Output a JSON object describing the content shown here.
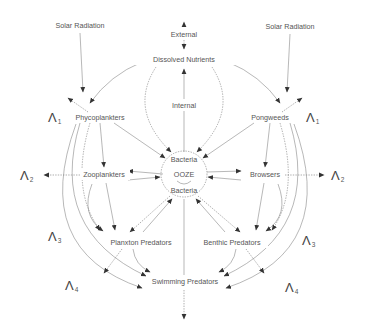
{
  "diagram": {
    "colors": {
      "line": "#888888",
      "text": "#555555",
      "background": "#ffffff"
    },
    "nodes": {
      "solar_left": "Solar Radiation",
      "solar_right": "Solar Radiation",
      "external": "External",
      "dissolved": "Dissolved Nutrients",
      "internal": "Internal",
      "phyco": "Phycoplankters",
      "pong": "Pongweeds",
      "bacteria_top": "Bacteria",
      "ooze": "OOZE",
      "bacteria_bottom": "Bacteria",
      "zoo": "Zooplankters",
      "browsers": "Browsers",
      "planxton_pred": "Planxton Predators",
      "benthic_pred": "Benthic Predators",
      "swimming_pred": "Swimming Predators"
    },
    "losses": {
      "symbol": "Λ",
      "left": [
        {
          "sub": "1"
        },
        {
          "sub": "2"
        },
        {
          "sub": "3"
        },
        {
          "sub": "4"
        }
      ],
      "right": [
        {
          "sub": "1"
        },
        {
          "sub": "2"
        },
        {
          "sub": "3"
        },
        {
          "sub": "4"
        }
      ]
    }
  }
}
